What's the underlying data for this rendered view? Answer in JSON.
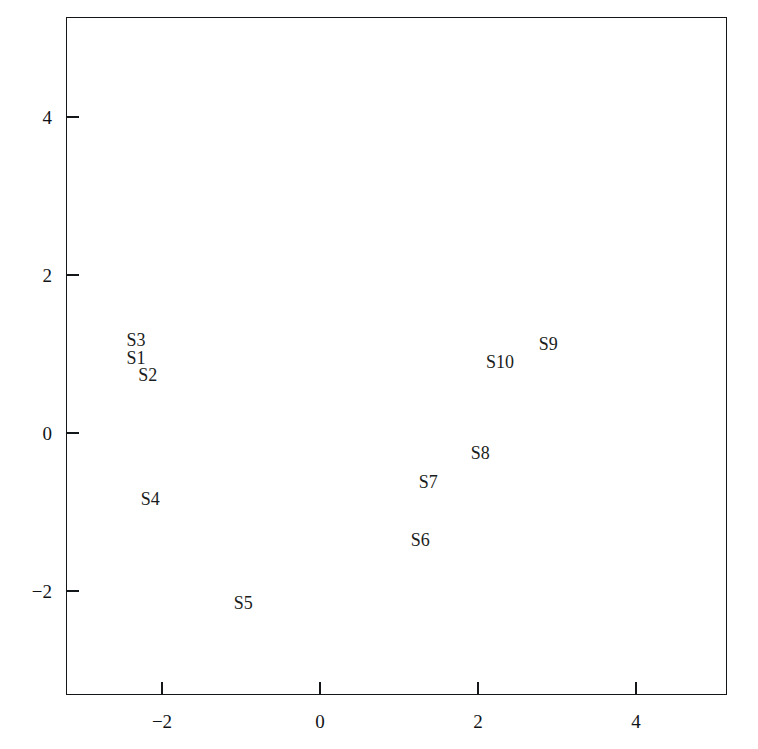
{
  "chart_data": {
    "type": "scatter",
    "title": "",
    "subtitle": "",
    "xlabel": "",
    "ylabel": "",
    "xlim": [
      -3.2,
      4.95
    ],
    "ylim": [
      -3.3,
      5.3
    ],
    "xticks": [
      -2,
      0,
      2,
      4
    ],
    "xticklabels": [
      "−2",
      "0",
      "2",
      "4"
    ],
    "yticks": [
      4,
      2,
      0,
      -2
    ],
    "yticklabels": [
      "4",
      "2",
      "0",
      "−2"
    ],
    "grid": false,
    "legend": false,
    "marker_style": "text-label-only",
    "points": [
      {
        "label": "S1",
        "x": -2.33,
        "y": 0.95
      },
      {
        "label": "S2",
        "x": -2.18,
        "y": 0.73
      },
      {
        "label": "S3",
        "x": -2.33,
        "y": 1.18
      },
      {
        "label": "S4",
        "x": -2.15,
        "y": -0.84
      },
      {
        "label": "S5",
        "x": -0.97,
        "y": -2.15
      },
      {
        "label": "S6",
        "x": 1.27,
        "y": -1.35
      },
      {
        "label": "S7",
        "x": 1.37,
        "y": -0.62
      },
      {
        "label": "S8",
        "x": 2.03,
        "y": -0.25
      },
      {
        "label": "S9",
        "x": 2.89,
        "y": 1.13
      },
      {
        "label": "S10",
        "x": 2.28,
        "y": 0.9
      }
    ]
  },
  "style": {
    "axis_color": "#14171a",
    "text_color": "#1a1d20",
    "background": "#ffffff"
  },
  "geometry": {
    "frame_left": 66,
    "frame_top": 17,
    "frame_right": 727,
    "frame_bottom": 695,
    "x_origin_px": 320,
    "y_origin_px": 433,
    "x_scale_px_per_unit": 79,
    "y_scale_px_per_unit": 79
  }
}
